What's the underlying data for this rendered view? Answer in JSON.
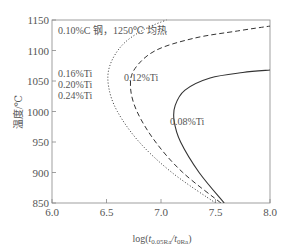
{
  "chart_data": {
    "type": "line",
    "title": "",
    "xlabel": "log(t0.05Ra/t0Ra)",
    "xlabel_main": "log(",
    "xlabel_t1": "t",
    "xlabel_sub1": "0.05Ra",
    "xlabel_slash": "/t",
    "xlabel_sub2": "0Ra",
    "xlabel_close": ")",
    "ylabel": "温度/℃",
    "xlim": [
      6.0,
      8.0
    ],
    "ylim": [
      850,
      1150
    ],
    "xticks": [
      "6.0",
      "6.5",
      "7.0",
      "7.5",
      "8.0"
    ],
    "yticks": [
      "850",
      "900",
      "950",
      "1000",
      "1050",
      "1100",
      "1150"
    ],
    "grid": false,
    "annotation": "0.10%C 钢，1250℃ 均热",
    "series": [
      {
        "name": "0.08%Ti",
        "style": "solid",
        "label_lines": [
          "0.08%Ti"
        ],
        "points": [
          [
            7.58,
            850
          ],
          [
            7.35,
            900
          ],
          [
            7.18,
            950
          ],
          [
            7.12,
            985
          ],
          [
            7.13,
            1010
          ],
          [
            7.22,
            1035
          ],
          [
            7.45,
            1055
          ],
          [
            7.75,
            1064
          ],
          [
            8.0,
            1068
          ]
        ]
      },
      {
        "name": "0.12%Ti",
        "style": "dashed",
        "label_lines": [
          "0.12%Ti"
        ],
        "points": [
          [
            7.55,
            850
          ],
          [
            7.2,
            900
          ],
          [
            6.95,
            950
          ],
          [
            6.78,
            1000
          ],
          [
            6.72,
            1040
          ],
          [
            6.76,
            1070
          ],
          [
            6.95,
            1100
          ],
          [
            7.3,
            1120
          ],
          [
            7.7,
            1132
          ],
          [
            8.0,
            1140
          ]
        ]
      },
      {
        "name": "0.16%Ti / 0.20%Ti / 0.24%Ti",
        "style": "dotted",
        "label_lines": [
          "0.16%Ti",
          "0.20%Ti",
          "0.24%Ti"
        ],
        "points": [
          [
            7.5,
            850
          ],
          [
            7.1,
            900
          ],
          [
            6.8,
            950
          ],
          [
            6.6,
            1000
          ],
          [
            6.52,
            1040
          ],
          [
            6.53,
            1075
          ],
          [
            6.65,
            1110
          ],
          [
            6.85,
            1135
          ],
          [
            7.05,
            1150
          ]
        ]
      }
    ]
  }
}
